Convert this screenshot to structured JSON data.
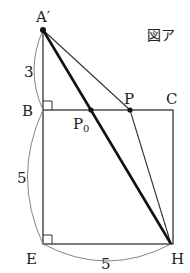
{
  "figure": {
    "caption": "図ア",
    "points": {
      "A_prime": {
        "label": "A′",
        "x": 43,
        "y": 30
      },
      "B": {
        "label": "B",
        "x": 43,
        "y": 110
      },
      "C": {
        "label": "C",
        "x": 173,
        "y": 110
      },
      "E": {
        "label": "E",
        "x": 43,
        "y": 244
      },
      "H": {
        "label": "H",
        "x": 171,
        "y": 244
      },
      "P": {
        "label": "P",
        "x": 130,
        "y": 110
      },
      "P0": {
        "label": "P",
        "sub": "0",
        "x": 91,
        "y": 110
      }
    },
    "lengths": {
      "A_prime_B": "3",
      "B_E": "5",
      "E_H": "5"
    }
  }
}
